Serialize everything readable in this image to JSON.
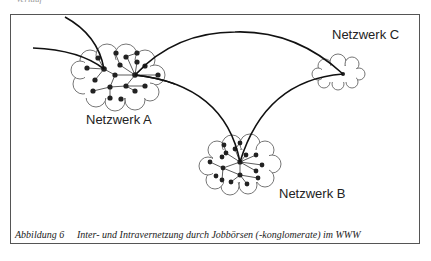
{
  "top_fragment": "Verlauf",
  "labels": {
    "network_a": "Netzwerk A",
    "network_b": "Netzwerk B",
    "network_c": "Netzwerk C"
  },
  "caption": {
    "figure_number": "Abbildung 6",
    "text": "Inter- und Intravernetzung durch Jobbörsen (-konglomerate) im WWW"
  },
  "colors": {
    "line": "#111111",
    "cloud_stroke": "#555555",
    "node": "#222222",
    "frame": "#555555"
  }
}
